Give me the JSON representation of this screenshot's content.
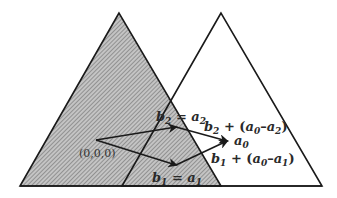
{
  "diagram": {
    "colors": {
      "stroke": "#1a1a1a",
      "hatch_bg": "#bdbdbd",
      "hatch_line": "#6a6a6a",
      "background": "#ffffff"
    },
    "triangles": [
      {
        "name": "left-shaded-triangle",
        "points": [
          [
            119,
            13
          ],
          [
            20,
            186
          ],
          [
            221,
            186
          ]
        ],
        "fill": "hatched"
      },
      {
        "name": "right-outline-triangle",
        "points": [
          [
            221,
            13
          ],
          [
            122,
            186
          ],
          [
            322,
            186
          ]
        ],
        "fill": "none"
      }
    ],
    "origin": {
      "label": "(0,0,0)",
      "point": [
        96,
        140
      ]
    },
    "points": {
      "b2": [
        176,
        127
      ],
      "b1": [
        176,
        165
      ],
      "a0": [
        227,
        141
      ]
    },
    "labels": {
      "b2_eq_a2": {
        "b": "b",
        "b_sub": "2",
        "eq": " = ",
        "a": "a",
        "a_sub": "2"
      },
      "b2_plus": {
        "b": "b",
        "b_sub": "2",
        "rest1": " + (",
        "a0": "a",
        "a0_sub": "0",
        "dash": "–",
        "a2": "a",
        "a2_sub": "2",
        "close": ")"
      },
      "a0": {
        "a": "a",
        "sub": "0"
      },
      "b1_plus": {
        "b": "b",
        "b_sub": "1",
        "rest1": " + (",
        "a0": "a",
        "a0_sub": "0",
        "dash": "–",
        "a1": "a",
        "a1_sub": "1",
        "close": ")"
      },
      "b1_eq_a1": {
        "b": "b",
        "b_sub": "1",
        "eq": " = ",
        "a": "a",
        "a_sub": "1"
      }
    }
  }
}
